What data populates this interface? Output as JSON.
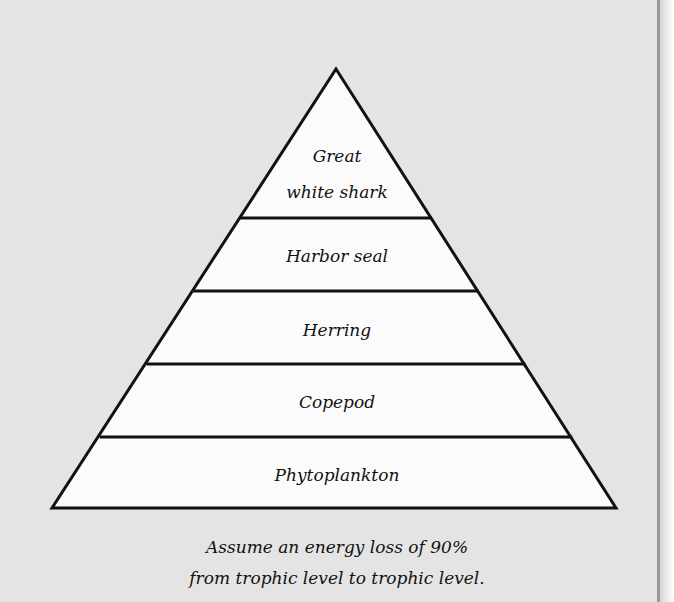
{
  "diagram": {
    "type": "energy-pyramid",
    "levels": [
      {
        "label_line1": "Great",
        "label_line2": "white shark"
      },
      {
        "label": "Harbor seal"
      },
      {
        "label": "Herring"
      },
      {
        "label": "Copepod"
      },
      {
        "label": "Phytoplankton"
      }
    ],
    "caption": {
      "line1": "Assume an energy loss of 90%",
      "line2": "from trophic level to trophic level."
    },
    "colors": {
      "background": "#e4e4e4",
      "pyramid_fill": "#fbfbfb",
      "stroke": "#111111"
    }
  }
}
